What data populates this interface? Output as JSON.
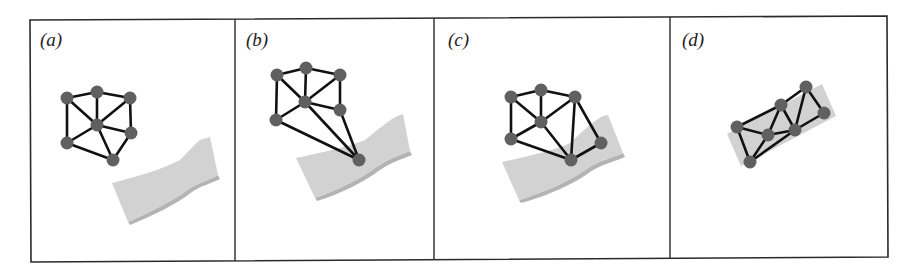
{
  "figure": {
    "panels": [
      {
        "label": "(a)",
        "label_pos": [
          40,
          46
        ],
        "surface": "M112,183 C140,176 165,168 180,160 C190,150 196,143 200,140 L210,137 L218,175 C210,180 200,182 190,188 C175,200 150,212 128,222 Z",
        "surface_shadow": "M128,222 C150,212 175,200 190,188 C200,182 210,180 218,175 L220,179 C210,184 200,186 192,192 C177,204 152,216 130,225 Z",
        "nodes": [
          [
            67,
            98
          ],
          [
            97,
            92
          ],
          [
            130,
            98
          ],
          [
            97,
            125
          ],
          [
            131,
            133
          ],
          [
            67,
            143
          ],
          [
            113,
            160
          ]
        ],
        "edges": [
          [
            0,
            1
          ],
          [
            1,
            2
          ],
          [
            0,
            3
          ],
          [
            1,
            3
          ],
          [
            2,
            3
          ],
          [
            2,
            4
          ],
          [
            3,
            4
          ],
          [
            0,
            5
          ],
          [
            5,
            3
          ],
          [
            5,
            6
          ],
          [
            3,
            6
          ],
          [
            4,
            6
          ]
        ]
      },
      {
        "label": "(b)",
        "label_pos": [
          246,
          46
        ],
        "surface": "M296,158 C325,152 350,146 365,140 C378,130 388,120 400,115 L403,114 L410,151 C400,155 390,158 378,166 C362,178 338,190 315,198 Z",
        "surface_shadow": "M315,198 C338,190 362,178 378,166 C390,158 400,155 410,151 L412,155 C402,159 392,162 380,170 C364,182 340,194 317,201 Z",
        "nodes": [
          [
            277,
            75
          ],
          [
            306,
            68
          ],
          [
            340,
            75
          ],
          [
            305,
            102
          ],
          [
            340,
            110
          ],
          [
            276,
            120
          ],
          [
            359,
            160
          ]
        ],
        "edges": [
          [
            0,
            1
          ],
          [
            1,
            2
          ],
          [
            0,
            3
          ],
          [
            1,
            3
          ],
          [
            2,
            3
          ],
          [
            2,
            4
          ],
          [
            3,
            4
          ],
          [
            0,
            5
          ],
          [
            5,
            3
          ],
          [
            5,
            6
          ],
          [
            3,
            6
          ],
          [
            4,
            6
          ]
        ]
      },
      {
        "label": "(c)",
        "label_pos": [
          448,
          46
        ],
        "surface": "M502,162 C530,156 555,150 570,143 C582,132 592,122 603,116 L608,115 L623,153 C612,158 600,160 588,168 C572,180 545,192 519,200 Z",
        "surface_shadow": "M519,200 C545,192 572,180 588,168 C600,160 612,158 623,153 L625,157 C614,162 602,164 590,172 C574,184 547,196 521,203 Z",
        "nodes": [
          [
            511,
            97
          ],
          [
            541,
            90
          ],
          [
            575,
            97
          ],
          [
            541,
            122
          ],
          [
            601,
            143
          ],
          [
            511,
            139
          ],
          [
            571,
            160
          ]
        ],
        "edges": [
          [
            0,
            1
          ],
          [
            1,
            2
          ],
          [
            0,
            3
          ],
          [
            1,
            3
          ],
          [
            3,
            2
          ],
          [
            0,
            5
          ],
          [
            5,
            3
          ],
          [
            5,
            6
          ],
          [
            3,
            6
          ],
          [
            2,
            6
          ],
          [
            2,
            4
          ],
          [
            4,
            6
          ]
        ]
      },
      {
        "label": "(d)",
        "label_pos": [
          682,
          46
        ],
        "surface": "M727,134 L822,84 L836,116 L741,166 Z",
        "surface_shadow": "",
        "nodes": [
          [
            737,
            127
          ],
          [
            781,
            105
          ],
          [
            806,
            87
          ],
          [
            824,
            113
          ],
          [
            768,
            135
          ],
          [
            795,
            130
          ],
          [
            750,
            162
          ]
        ],
        "edges": [
          [
            0,
            1
          ],
          [
            1,
            2
          ],
          [
            2,
            3
          ],
          [
            0,
            4
          ],
          [
            0,
            6
          ],
          [
            4,
            6
          ],
          [
            4,
            1
          ],
          [
            1,
            5
          ],
          [
            2,
            5
          ],
          [
            4,
            5
          ],
          [
            5,
            3
          ],
          [
            6,
            5
          ]
        ]
      }
    ],
    "frame": {
      "outer": "M30,20 L887,16 L888,257 L31,262 Z",
      "dividers": [
        [
          235,
          19,
          235,
          261
        ],
        [
          434,
          18,
          434,
          260
        ],
        [
          670,
          17,
          670,
          258
        ]
      ]
    },
    "colors": {
      "node": "#606060",
      "edge": "#111111",
      "surface": "#d2d2d2",
      "surface_edge": "#b4b4b4",
      "frame": "#2a2a2a"
    }
  }
}
